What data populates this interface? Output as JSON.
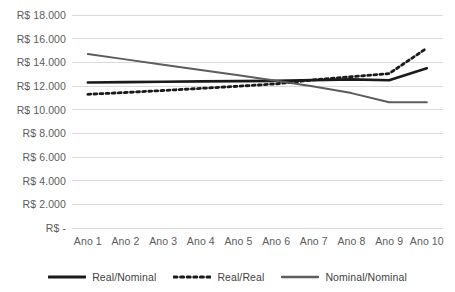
{
  "chart_data": {
    "type": "line",
    "title": "",
    "subtitle": "",
    "xlabel": "",
    "ylabel": "",
    "grid": true,
    "grid_axis": "y",
    "legend_position": "bottom",
    "categories": [
      "Ano 1",
      "Ano 2",
      "Ano 3",
      "Ano 4",
      "Ano 5",
      "Ano 6",
      "Ano 7",
      "Ano 8",
      "Ano 9",
      "Ano 10"
    ],
    "ylim": [
      0,
      18000
    ],
    "ytick_values": [
      0,
      2000,
      4000,
      6000,
      8000,
      10000,
      12000,
      14000,
      16000,
      18000
    ],
    "ytick_labels": [
      "R$ -",
      "R$ 2.000",
      "R$ 4.000",
      "R$ 6.000",
      "R$ 8.000",
      "R$ 10.000",
      "R$ 12.000",
      "R$ 14.000",
      "R$ 16.000",
      "R$ 18.000"
    ],
    "currency_prefix": "R$",
    "series": [
      {
        "name": "Real/Nominal",
        "style": "solid",
        "color": "#1a1a1a",
        "width": 2.6,
        "values": [
          12300,
          12330,
          12360,
          12390,
          12410,
          12430,
          12500,
          12560,
          12480,
          13500
        ]
      },
      {
        "name": "Real/Real",
        "style": "dotted",
        "color": "#1a1a1a",
        "width": 2.8,
        "values": [
          11300,
          11450,
          11620,
          11800,
          11980,
          12180,
          12520,
          12780,
          13050,
          15200
        ]
      },
      {
        "name": "Nominal/Nominal",
        "style": "solid",
        "color": "#5c5c5c",
        "width": 2.0,
        "values": [
          14700,
          14250,
          13800,
          13350,
          12900,
          12450,
          11950,
          11400,
          10620,
          10620
        ]
      }
    ]
  },
  "legend": {
    "items": [
      {
        "label": "Real/Nominal",
        "style": "solid",
        "color": "#1a1a1a",
        "width": 3.0
      },
      {
        "label": "Real/Real",
        "style": "dotted",
        "color": "#1a1a1a",
        "width": 3.0
      },
      {
        "label": "Nominal/Nominal",
        "style": "solid",
        "color": "#5c5c5c",
        "width": 2.4
      }
    ]
  },
  "colors": {
    "background": "#ffffff",
    "gridline": "#d9d9d9",
    "axis_text": "#5c5c5c",
    "legend_text": "#3f3f3f",
    "series_dark": "#1a1a1a",
    "series_gray": "#5c5c5c"
  }
}
